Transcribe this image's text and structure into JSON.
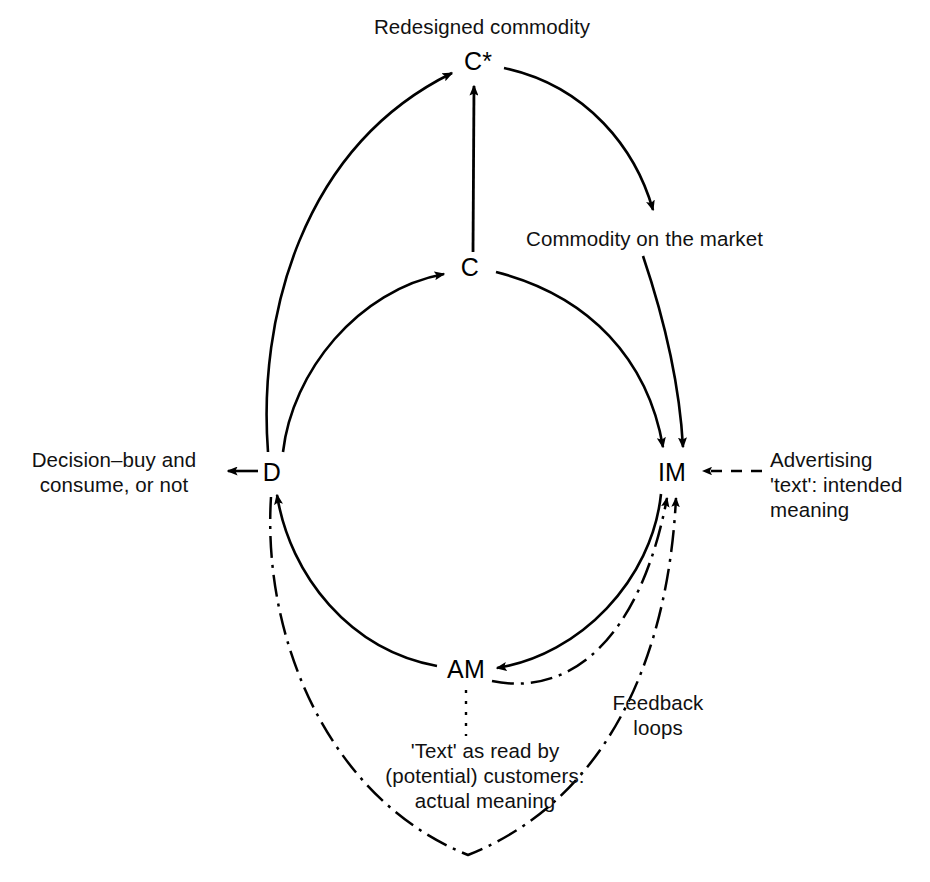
{
  "figure": {
    "background_color": "#ffffff",
    "ink_color": "#000000"
  },
  "nodes": [
    {
      "id": "C_star",
      "label": "C*",
      "x": 478,
      "y": 62,
      "meaning": "Redesigned commodity"
    },
    {
      "id": "C",
      "label": "C",
      "x": 470,
      "y": 268,
      "meaning": "Commodity"
    },
    {
      "id": "IM",
      "label": "IM",
      "x": 670,
      "y": 473,
      "meaning": "Intended meaning"
    },
    {
      "id": "AM",
      "label": "AM",
      "x": 465,
      "y": 670,
      "meaning": "Actual meaning"
    },
    {
      "id": "D",
      "label": "D",
      "x": 272,
      "y": 473,
      "meaning": "Decision"
    }
  ],
  "captions": {
    "redesigned_commodity": "Redesigned commodity",
    "commodity_on_market": "Commodity on the market",
    "decision": "Decision–buy and\nconsume, or not",
    "advertising_text": "Advertising\n'text': intended\nmeaning",
    "feedback_loops": "Feedback\nloops",
    "actual_meaning": "'Text' as read by\n(potential) customers:\nactual meaning"
  },
  "edges": [
    {
      "id": "d-to-cstar",
      "from": "D",
      "to": "C*",
      "style": "solid",
      "arrow": true,
      "note": "outer left arc upward"
    },
    {
      "id": "d-to-c",
      "from": "D",
      "to": "C",
      "style": "solid",
      "arrow": true,
      "note": "inner left arc upward"
    },
    {
      "id": "c-to-cstar",
      "from": "C",
      "to": "C*",
      "style": "solid",
      "arrow": true,
      "note": "vertical arrow"
    },
    {
      "id": "cstar-to-market",
      "from": "C*",
      "to": "Commodity on the market",
      "style": "solid",
      "arrow": true,
      "note": "outer right arc down to label"
    },
    {
      "id": "market-to-im",
      "from": "Commodity on the market",
      "to": "IM",
      "style": "solid",
      "arrow": true,
      "note": "outer right arc continues down to IM"
    },
    {
      "id": "c-to-im",
      "from": "C",
      "to": "IM",
      "style": "solid",
      "arrow": true,
      "note": "inner right arc down"
    },
    {
      "id": "im-to-am",
      "from": "IM",
      "to": "AM",
      "style": "solid",
      "arrow": true,
      "note": "inner arc lower right"
    },
    {
      "id": "am-to-d",
      "from": "AM",
      "to": "D",
      "style": "solid",
      "arrow": true,
      "note": "inner arc lower left"
    },
    {
      "id": "ad-to-im",
      "from": "Advertising 'text'",
      "to": "IM",
      "style": "dashed",
      "arrow": true,
      "note": "horizontal dashed"
    },
    {
      "id": "am-to-im-feedback",
      "from": "AM",
      "to": "IM",
      "style": "dash-dot",
      "arrow": true,
      "note": "short feedback loop"
    },
    {
      "id": "d-to-im-feedback",
      "from": "D",
      "to": "IM",
      "style": "dash-dot",
      "arrow": true,
      "note": "long feedback loop around the bottom"
    },
    {
      "id": "am-caption-leader",
      "from": "AM",
      "to": "actual meaning caption",
      "style": "dotted",
      "arrow": false,
      "note": "leader line"
    }
  ],
  "bleed_through_text": {
    "top_left": "",
    "top_right": "",
    "middle": "",
    "bottom_left": "",
    "bottom_right": ""
  }
}
